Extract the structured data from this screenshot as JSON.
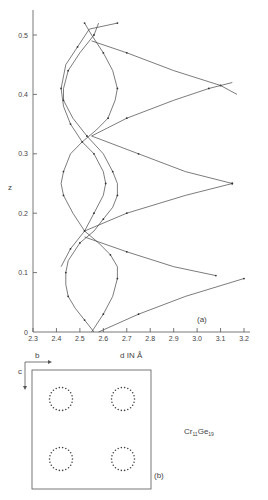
{
  "figure": {
    "panel_a_label": "(a)",
    "panel_b_label": "(b)",
    "compound": {
      "base1": "Cr",
      "sub1": "11",
      "base2": "Ge",
      "sub2": "19"
    },
    "axis_b_label": "b",
    "axis_c_label": "c"
  },
  "chart_data": {
    "type": "line",
    "title": "",
    "xlabel": "d IN Å",
    "ylabel": "z",
    "xlim": [
      2.3,
      3.2
    ],
    "ylim": [
      0,
      0.55
    ],
    "xticks": [
      "2.3",
      "2.4",
      "2.5",
      "2.6",
      "2.7",
      "2.8",
      "2.9",
      "3.0",
      "3.1",
      "3.2"
    ],
    "yticks": [
      "0",
      "0.1",
      "0.2",
      "0.3",
      "0.4",
      "0.5"
    ],
    "grid": false,
    "legend": null,
    "series": [
      {
        "name": "helix-1",
        "points": [
          [
            2.56,
            0.0
          ],
          [
            2.52,
            0.02
          ],
          [
            2.48,
            0.04
          ],
          [
            2.45,
            0.06
          ],
          [
            2.44,
            0.08
          ],
          [
            2.44,
            0.1
          ],
          [
            2.45,
            0.12
          ],
          [
            2.5,
            0.15
          ],
          [
            2.56,
            0.17
          ],
          [
            2.6,
            0.19
          ],
          [
            2.64,
            0.21
          ],
          [
            2.66,
            0.23
          ],
          [
            2.66,
            0.25
          ],
          [
            2.64,
            0.27
          ],
          [
            2.6,
            0.3
          ],
          [
            2.53,
            0.33
          ],
          [
            2.47,
            0.36
          ],
          [
            2.43,
            0.39
          ],
          [
            2.43,
            0.41
          ],
          [
            2.45,
            0.44
          ],
          [
            2.5,
            0.47
          ],
          [
            2.56,
            0.5
          ],
          [
            2.58,
            0.52
          ]
        ]
      },
      {
        "name": "helix-2",
        "points": [
          [
            2.55,
            0.0
          ],
          [
            2.6,
            0.03
          ],
          [
            2.64,
            0.06
          ],
          [
            2.66,
            0.09
          ],
          [
            2.66,
            0.11
          ],
          [
            2.63,
            0.13
          ],
          [
            2.58,
            0.15
          ],
          [
            2.52,
            0.17
          ],
          [
            2.47,
            0.2
          ],
          [
            2.43,
            0.23
          ],
          [
            2.42,
            0.25
          ],
          [
            2.43,
            0.27
          ],
          [
            2.46,
            0.3
          ],
          [
            2.51,
            0.32
          ],
          [
            2.57,
            0.34
          ],
          [
            2.62,
            0.36
          ],
          [
            2.65,
            0.39
          ],
          [
            2.66,
            0.41
          ],
          [
            2.64,
            0.44
          ],
          [
            2.6,
            0.47
          ],
          [
            2.55,
            0.5
          ],
          [
            2.52,
            0.52
          ]
        ]
      },
      {
        "name": "helix-3",
        "points": [
          [
            2.42,
            0.11
          ],
          [
            2.46,
            0.14
          ],
          [
            2.52,
            0.17
          ],
          [
            2.56,
            0.2
          ],
          [
            2.6,
            0.23
          ],
          [
            2.61,
            0.25
          ],
          [
            2.6,
            0.27
          ],
          [
            2.56,
            0.3
          ],
          [
            2.51,
            0.32
          ],
          [
            2.46,
            0.35
          ],
          [
            2.43,
            0.38
          ],
          [
            2.42,
            0.41
          ],
          [
            2.44,
            0.45
          ],
          [
            2.49,
            0.48
          ],
          [
            2.54,
            0.51
          ],
          [
            2.66,
            0.52
          ]
        ]
      },
      {
        "name": "branch-top",
        "points": [
          [
            2.55,
            0.49
          ],
          [
            2.7,
            0.47
          ],
          [
            2.9,
            0.44
          ],
          [
            3.1,
            0.415
          ],
          [
            3.17,
            0.4
          ]
        ]
      },
      {
        "name": "branch-top-lower",
        "points": [
          [
            2.55,
            0.33
          ],
          [
            2.7,
            0.36
          ],
          [
            2.9,
            0.39
          ],
          [
            3.05,
            0.41
          ],
          [
            3.15,
            0.42
          ]
        ]
      },
      {
        "name": "branch-mid-upper",
        "points": [
          [
            2.55,
            0.33
          ],
          [
            2.75,
            0.3
          ],
          [
            2.95,
            0.27
          ],
          [
            3.15,
            0.25
          ]
        ]
      },
      {
        "name": "branch-mid-lower",
        "points": [
          [
            2.52,
            0.17
          ],
          [
            2.7,
            0.2
          ],
          [
            2.95,
            0.23
          ],
          [
            3.15,
            0.25
          ]
        ]
      },
      {
        "name": "branch-low-upper",
        "points": [
          [
            2.52,
            0.16
          ],
          [
            2.7,
            0.135
          ],
          [
            2.9,
            0.11
          ],
          [
            3.08,
            0.095
          ]
        ]
      },
      {
        "name": "branch-bottom",
        "points": [
          [
            2.58,
            0.0
          ],
          [
            2.75,
            0.03
          ],
          [
            2.95,
            0.06
          ],
          [
            3.2,
            0.09
          ]
        ]
      }
    ],
    "annotations": [
      "(a)"
    ]
  }
}
